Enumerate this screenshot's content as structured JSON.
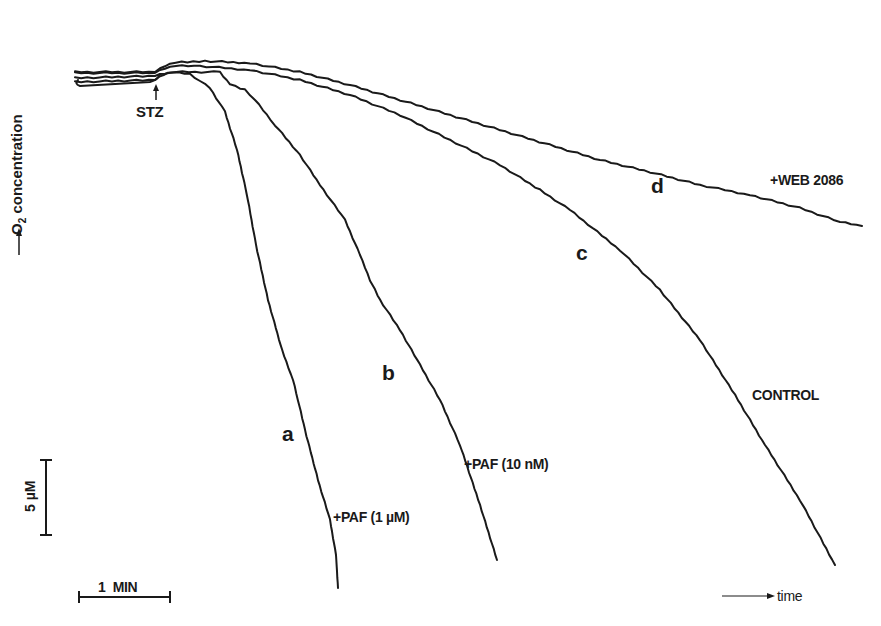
{
  "chart_data": {
    "type": "line",
    "title": "",
    "xlabel": "time",
    "ylabel": "O2 concentration",
    "grid": false,
    "legend": "inline labels on curves",
    "event_marker": {
      "label": "STZ",
      "x_px": 156
    },
    "scale_bars": {
      "vertical": {
        "label": "5 µM",
        "value": 5,
        "unit": "µM"
      },
      "horizontal": {
        "label": "1 MIN",
        "value": 1,
        "unit": "min"
      }
    },
    "series": [
      {
        "id": "a",
        "name": "+PAF (1 µM)",
        "points_px": [
          [
            75,
            82
          ],
          [
            155,
            80
          ],
          [
            168,
            72
          ],
          [
            190,
            74
          ],
          [
            210,
            88
          ],
          [
            225,
            112
          ],
          [
            237,
            150
          ],
          [
            247,
            195
          ],
          [
            256,
            245
          ],
          [
            268,
            300
          ],
          [
            282,
            350
          ],
          [
            293,
            380
          ],
          [
            298,
            400
          ],
          [
            305,
            430
          ],
          [
            318,
            480
          ],
          [
            330,
            520
          ],
          [
            336,
            555
          ],
          [
            338,
            588
          ]
        ]
      },
      {
        "id": "b",
        "name": "+PAF (10 nM)",
        "points_px": [
          [
            75,
            78
          ],
          [
            155,
            76
          ],
          [
            170,
            72
          ],
          [
            220,
            72
          ],
          [
            230,
            84
          ],
          [
            245,
            90
          ],
          [
            255,
            100
          ],
          [
            275,
            125
          ],
          [
            300,
            155
          ],
          [
            320,
            185
          ],
          [
            345,
            220
          ],
          [
            360,
            255
          ],
          [
            370,
            280
          ],
          [
            380,
            300
          ],
          [
            400,
            330
          ],
          [
            420,
            365
          ],
          [
            440,
            400
          ],
          [
            460,
            445
          ],
          [
            480,
            505
          ],
          [
            497,
            560
          ]
        ]
      },
      {
        "id": "c",
        "name": "CONTROL",
        "points_px": [
          [
            75,
            73
          ],
          [
            155,
            73
          ],
          [
            170,
            66
          ],
          [
            200,
            66
          ],
          [
            250,
            70
          ],
          [
            300,
            80
          ],
          [
            350,
            95
          ],
          [
            400,
            115
          ],
          [
            450,
            140
          ],
          [
            500,
            165
          ],
          [
            540,
            190
          ],
          [
            570,
            210
          ],
          [
            620,
            250
          ],
          [
            660,
            290
          ],
          [
            700,
            340
          ],
          [
            735,
            395
          ],
          [
            765,
            445
          ],
          [
            800,
            500
          ],
          [
            835,
            565
          ]
        ]
      },
      {
        "id": "d",
        "name": "+WEB 2086",
        "points_px": [
          [
            75,
            72
          ],
          [
            155,
            72
          ],
          [
            170,
            63
          ],
          [
            205,
            61
          ],
          [
            250,
            63
          ],
          [
            300,
            72
          ],
          [
            350,
            85
          ],
          [
            400,
            100
          ],
          [
            450,
            115
          ],
          [
            500,
            130
          ],
          [
            550,
            145
          ],
          [
            600,
            160
          ],
          [
            650,
            172
          ],
          [
            700,
            185
          ],
          [
            750,
            195
          ],
          [
            800,
            208
          ],
          [
            840,
            222
          ],
          [
            862,
            226
          ]
        ]
      }
    ]
  },
  "labels": {
    "y_axis": "O",
    "y_axis_sub": "2",
    "y_axis_rest": " concentration",
    "stz": "STZ",
    "curve_a": "a",
    "curve_b": "b",
    "curve_c": "c",
    "curve_d": "d",
    "annot_a": "+PAF (1 µM)",
    "annot_b": "+PAF (10 nM)",
    "annot_c": "CONTROL",
    "annot_d": "+WEB 2086",
    "scale_y": "5 µM",
    "scale_x": "1  MIN",
    "time": "time"
  },
  "colors": {
    "ink": "#1a1a1a",
    "background": "#ffffff"
  }
}
